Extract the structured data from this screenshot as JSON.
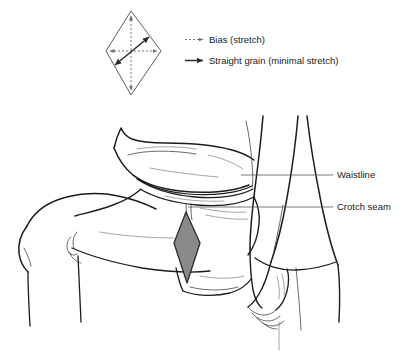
{
  "figure": {
    "title_present": false,
    "background_color": "#ffffff",
    "ink_color": "#1c1c1c",
    "gusset_fill_color": "#8a8a8a",
    "gusset_stroke_color": "#2b2b2b",
    "leader_line_color": "#555555"
  },
  "grain_diagram": {
    "name": "gusset-grain-diamond",
    "shape": "diamond",
    "arrows": [
      {
        "id": "vertical-bias",
        "type": "bias",
        "style": "dashed",
        "double_headed": true,
        "orientation": "vertical"
      },
      {
        "id": "horizontal-bias",
        "type": "bias",
        "style": "dashed",
        "double_headed": true,
        "orientation": "horizontal"
      },
      {
        "id": "diagonal-straight-grain",
        "type": "straight-grain",
        "style": "solid",
        "double_headed": true,
        "orientation": "diagonal-lower-left-to-upper-right"
      }
    ]
  },
  "legend": {
    "items": [
      {
        "label": "Bias (stretch)",
        "marker": "dashed-arrow",
        "marker_color": "#6e6e6e"
      },
      {
        "label": "Straight grain (minimal stretch)",
        "marker": "solid-arrow",
        "marker_color": "#2b2b2b"
      }
    ]
  },
  "illustration": {
    "name": "seated-figure-lap-line-drawing",
    "description_present": false,
    "callouts": [
      {
        "label": "Waistline",
        "target": "garment-waistline"
      },
      {
        "label": "Crotch seam",
        "target": "garment-crotch-seam"
      }
    ],
    "highlight": {
      "name": "gusset-diamond",
      "fill": "#8a8a8a"
    }
  }
}
